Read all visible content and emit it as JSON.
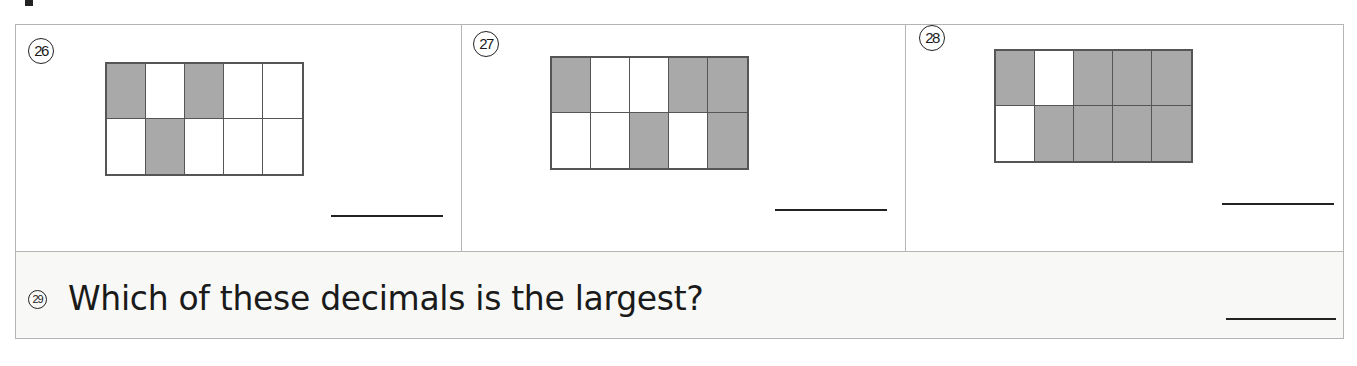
{
  "worksheet": {
    "questions": [
      {
        "number": "26",
        "grid": {
          "rows": 2,
          "cols": 5,
          "shaded": [
            [
              1,
              0,
              1,
              0,
              0
            ],
            [
              0,
              1,
              0,
              0,
              0
            ]
          ]
        },
        "answer": ""
      },
      {
        "number": "27",
        "grid": {
          "rows": 2,
          "cols": 5,
          "shaded": [
            [
              1,
              0,
              0,
              1,
              1
            ],
            [
              0,
              0,
              1,
              0,
              1
            ]
          ]
        },
        "answer": ""
      },
      {
        "number": "28",
        "grid": {
          "rows": 2,
          "cols": 5,
          "shaded": [
            [
              1,
              0,
              1,
              1,
              1
            ],
            [
              0,
              1,
              1,
              1,
              1
            ]
          ]
        },
        "answer": ""
      }
    ],
    "question_29": {
      "number": "29",
      "text": "Which of these decimals is the largest?",
      "answer": ""
    },
    "colors": {
      "shaded": "#a9a9a9",
      "border": "#555555",
      "frame": "#b5b5b5",
      "bottom_bg": "#f8f8f6"
    }
  }
}
